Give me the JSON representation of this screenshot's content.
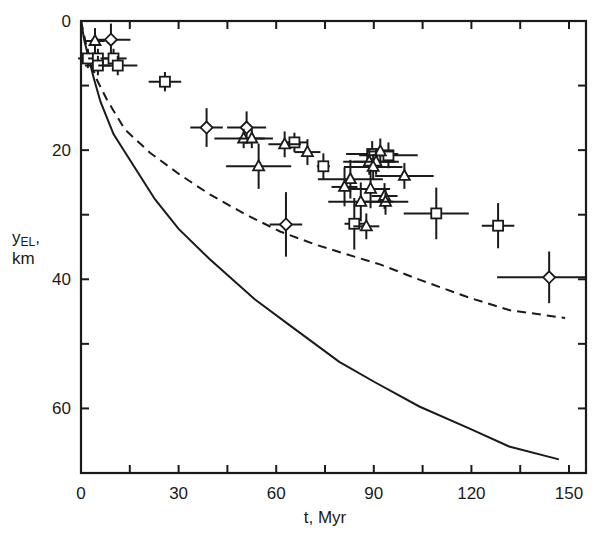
{
  "chart_data": {
    "type": "scatter",
    "title": "",
    "xlabel": "t, Myr",
    "ylabel": "yEL, km",
    "ylabel_parts": {
      "main": "y",
      "sub": "EL",
      "suffix": ",",
      "unit": "km"
    },
    "xlim": [
      0,
      155
    ],
    "ylim": [
      0,
      70
    ],
    "y_inverted": true,
    "grid": false,
    "legend": null,
    "x_ticks": [
      0,
      30,
      60,
      90,
      120,
      150
    ],
    "x_minor_ticks": [
      15,
      45,
      75,
      105,
      135
    ],
    "y_ticks": [
      0,
      20,
      40,
      60
    ],
    "y_minor_ticks": [
      10,
      30,
      50
    ],
    "curves": [
      {
        "name": "solid-model-curve",
        "style": "solid",
        "points": [
          [
            0,
            0
          ],
          [
            1,
            3
          ],
          [
            2.5,
            6
          ],
          [
            4,
            9
          ],
          [
            6,
            12.5
          ],
          [
            10,
            17.5
          ],
          [
            15,
            21.5
          ],
          [
            22.7,
            27.6
          ],
          [
            30,
            32.2
          ],
          [
            39.6,
            36.9
          ],
          [
            53.4,
            43.1
          ],
          [
            64.1,
            47.1
          ],
          [
            79.4,
            52.8
          ],
          [
            90.2,
            55.9
          ],
          [
            104,
            59.7
          ],
          [
            119.3,
            63.1
          ],
          [
            131.6,
            65.9
          ],
          [
            146.9,
            67.9
          ]
        ]
      },
      {
        "name": "dashed-model-curve",
        "style": "dashed",
        "points": [
          [
            0,
            0
          ],
          [
            1.5,
            3.5
          ],
          [
            3,
            6.5
          ],
          [
            4.9,
            9.1
          ],
          [
            8,
            12.2
          ],
          [
            13.5,
            16.8
          ],
          [
            21.2,
            20.4
          ],
          [
            30.4,
            23.8
          ],
          [
            39.7,
            26.9
          ],
          [
            50.4,
            29.9
          ],
          [
            61.2,
            32.6
          ],
          [
            71.9,
            34.6
          ],
          [
            79.6,
            35.8
          ],
          [
            91.9,
            37.7
          ],
          [
            104.2,
            40.1
          ],
          [
            119.6,
            42.9
          ],
          [
            131.9,
            44.8
          ],
          [
            148.8,
            46.0
          ]
        ]
      }
    ],
    "series": [
      {
        "name": "diamonds",
        "marker": "diamond",
        "points": [
          {
            "t": 9.2,
            "y": 2.9,
            "xerr": 6,
            "yerr": 2.5
          },
          {
            "t": 38.6,
            "y": 16.5,
            "xerr": 5,
            "yerr": 3
          },
          {
            "t": 50.9,
            "y": 16.5,
            "xerr": 6,
            "yerr": 2.5
          },
          {
            "t": 63.0,
            "y": 31.5,
            "xerr": 5,
            "yerr": 5
          },
          {
            "t": 143.9,
            "y": 39.7,
            "xerr": 16,
            "yerr": 4
          }
        ]
      },
      {
        "name": "squares",
        "marker": "square",
        "points": [
          {
            "t": 2.1,
            "y": 5.8,
            "xerr": 3,
            "yerr": 1.5
          },
          {
            "t": 5.2,
            "y": 5.8,
            "xerr": 3,
            "yerr": 1.5
          },
          {
            "t": 5.2,
            "y": 6.9,
            "xerr": 4,
            "yerr": 1.5
          },
          {
            "t": 10.0,
            "y": 5.8,
            "xerr": 4,
            "yerr": 1.5
          },
          {
            "t": 11.3,
            "y": 6.9,
            "xerr": 6,
            "yerr": 1.5
          },
          {
            "t": 25.8,
            "y": 9.4,
            "xerr": 5,
            "yerr": 1.5
          },
          {
            "t": 65.6,
            "y": 18.8,
            "xerr": 4,
            "yerr": 1.5
          },
          {
            "t": 74.5,
            "y": 22.5,
            "xerr": 2,
            "yerr": 2
          },
          {
            "t": 89.5,
            "y": 20.6,
            "xerr": 8,
            "yerr": 2
          },
          {
            "t": 94.5,
            "y": 20.8,
            "xerr": 9,
            "yerr": 2
          },
          {
            "t": 84.0,
            "y": 31.4,
            "xerr": 3,
            "yerr": 4
          },
          {
            "t": 109.2,
            "y": 29.8,
            "xerr": 10,
            "yerr": 4
          },
          {
            "t": 128.2,
            "y": 31.7,
            "xerr": 5,
            "yerr": 3.5
          }
        ]
      },
      {
        "name": "triangles",
        "marker": "triangle",
        "points": [
          {
            "t": 4.3,
            "y": 3.1,
            "xerr": 3,
            "yerr": 2
          },
          {
            "t": 50.0,
            "y": 18.2,
            "xerr": 9,
            "yerr": 1.5
          },
          {
            "t": 52.5,
            "y": 18.2,
            "xerr": 4,
            "yerr": 1.5
          },
          {
            "t": 54.6,
            "y": 22.5,
            "xerr": 10,
            "yerr": 3.5
          },
          {
            "t": 62.6,
            "y": 19.1,
            "xerr": 5,
            "yerr": 2
          },
          {
            "t": 69.6,
            "y": 20.3,
            "xerr": 4,
            "yerr": 2
          },
          {
            "t": 92.0,
            "y": 20.2,
            "xerr": 4,
            "yerr": 2
          },
          {
            "t": 88.6,
            "y": 21.8,
            "xerr": 8,
            "yerr": 2
          },
          {
            "t": 90.7,
            "y": 21.8,
            "xerr": 7,
            "yerr": 2
          },
          {
            "t": 89.8,
            "y": 22.6,
            "xerr": 9,
            "yerr": 2
          },
          {
            "t": 99.4,
            "y": 24.0,
            "xerr": 9,
            "yerr": 2
          },
          {
            "t": 82.8,
            "y": 24.5,
            "xerr": 10,
            "yerr": 3
          },
          {
            "t": 81.0,
            "y": 25.7,
            "xerr": 4,
            "yerr": 3
          },
          {
            "t": 89.0,
            "y": 26.0,
            "xerr": 6,
            "yerr": 3
          },
          {
            "t": 93.3,
            "y": 27.1,
            "xerr": 4,
            "yerr": 2
          },
          {
            "t": 93.6,
            "y": 28.0,
            "xerr": 7,
            "yerr": 2
          },
          {
            "t": 86.0,
            "y": 28.0,
            "xerr": 10,
            "yerr": 3
          },
          {
            "t": 87.7,
            "y": 31.8,
            "xerr": 4,
            "yerr": 2
          }
        ]
      }
    ]
  },
  "axes": {
    "x_label": "t, Myr",
    "y_label_main": "y",
    "y_label_sub": "EL",
    "y_label_suffix": ",",
    "y_label_unit": "km"
  }
}
